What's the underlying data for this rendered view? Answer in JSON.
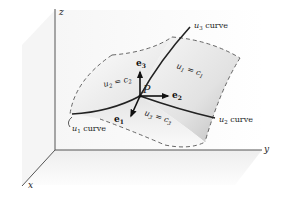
{
  "figure": {
    "axes": {
      "x_label": "x",
      "y_label": "y",
      "z_label": "z"
    },
    "point": {
      "label": "P"
    },
    "vectors": [
      {
        "name": "e1",
        "base": "e",
        "sub": "1"
      },
      {
        "name": "e2",
        "base": "e",
        "sub": "2"
      },
      {
        "name": "e3",
        "base": "e",
        "sub": "3"
      }
    ],
    "curves": [
      {
        "name": "u1",
        "base": "u",
        "sub": "1",
        "suffix": " curve"
      },
      {
        "name": "u2",
        "base": "u",
        "sub": "2",
        "suffix": " curve"
      },
      {
        "name": "u3",
        "base": "u",
        "sub": "3",
        "suffix": " curve"
      }
    ],
    "surfaces": [
      {
        "u_base": "u",
        "u_sub": "1",
        "eq": " = ",
        "c_base": "c",
        "c_sub": "1"
      },
      {
        "u_base": "u",
        "u_sub": "2",
        "eq": " = ",
        "c_base": "c",
        "c_sub": "2"
      },
      {
        "u_base": "u",
        "u_sub": "3",
        "eq": " = ",
        "c_base": "c",
        "c_sub": "3"
      }
    ],
    "colors": {
      "line": "#2a2a2a",
      "dash": "#555555",
      "shade_dark": "#c8c8c8",
      "shade_light": "#f4f4f4"
    }
  }
}
